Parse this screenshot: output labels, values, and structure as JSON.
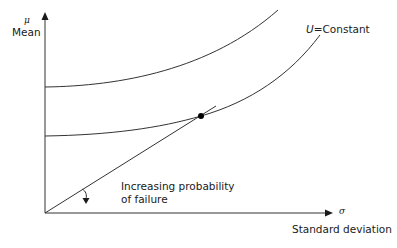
{
  "diagram": {
    "y_axis": {
      "symbol": "μ",
      "label": "Mean"
    },
    "x_axis": {
      "symbol": "σ",
      "label": "Standard deviation"
    },
    "curve_label": {
      "var": "U",
      "eq": "=",
      "text": "Constant"
    },
    "annotation": {
      "line1": "Increasing probability",
      "line2": "of failure"
    },
    "colors": {
      "stroke": "#333333",
      "text": "#1a1a1a"
    }
  }
}
